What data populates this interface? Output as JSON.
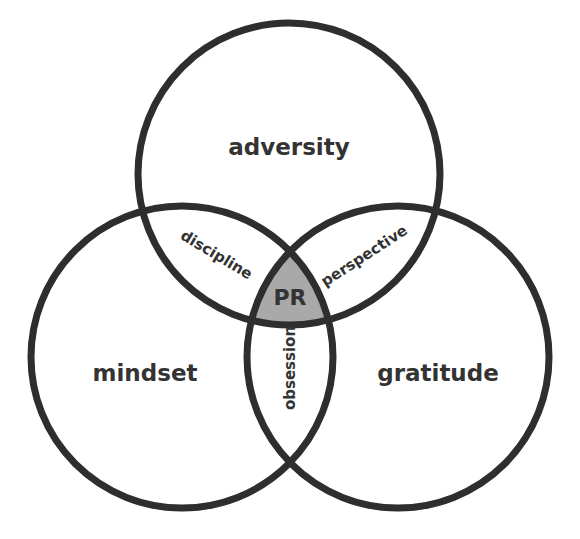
{
  "diagram": {
    "type": "venn-3",
    "colors": {
      "stroke": "#2e2e2e",
      "text": "#333333",
      "center_fill": "#a9a9a9",
      "background": "#ffffff"
    },
    "sets": [
      {
        "id": "top",
        "label": "adversity"
      },
      {
        "id": "left",
        "label": "mindset"
      },
      {
        "id": "right",
        "label": "gratitude"
      }
    ],
    "intersections": [
      {
        "sets": [
          "top",
          "left"
        ],
        "label": "discipline"
      },
      {
        "sets": [
          "top",
          "right"
        ],
        "label": "perspective"
      },
      {
        "sets": [
          "left",
          "right"
        ],
        "label": "obsession"
      },
      {
        "sets": [
          "top",
          "left",
          "right"
        ],
        "label": "PR"
      }
    ]
  }
}
